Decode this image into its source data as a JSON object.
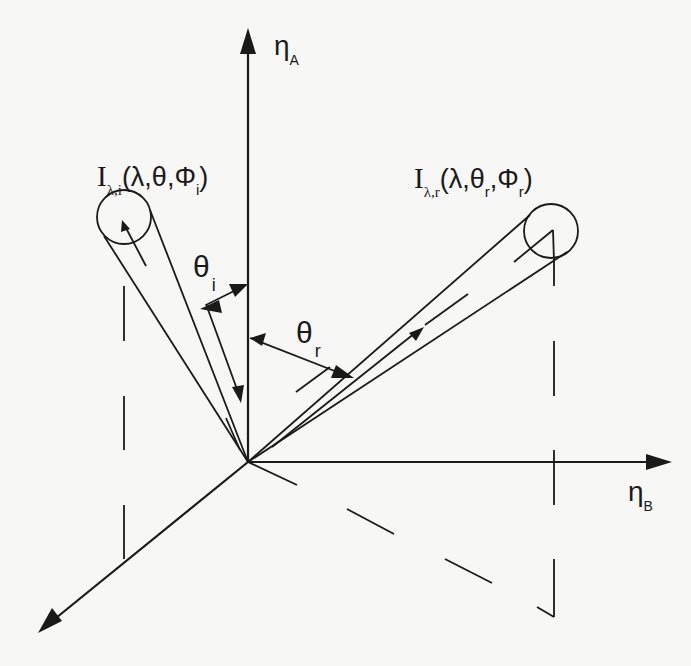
{
  "figure": {
    "type": "BRDF geometry diagram",
    "axes": {
      "vertical": {
        "symbol": "η",
        "subscript": "A"
      },
      "horizontal": {
        "symbol": "η",
        "subscript": "B"
      },
      "diagonal": {
        "label": ""
      }
    },
    "incident": {
      "symbol": "I",
      "subscript": "λ,i",
      "args": "(λ,θ,Φ",
      "arg_subscript": "i",
      "close": ")"
    },
    "reflected": {
      "symbol": "I",
      "subscript": "λ,r",
      "args_part1": "(λ,θ",
      "args_sub1": "r",
      "args_part2": ",Φ",
      "args_sub2": "r",
      "close": ")"
    },
    "angle_incident": {
      "symbol": "θ",
      "subscript": "i"
    },
    "angle_reflected": {
      "symbol": "θ",
      "subscript": "r"
    }
  },
  "colors": {
    "ink": "#1a1a1a",
    "paper": "#f7f7f5"
  }
}
